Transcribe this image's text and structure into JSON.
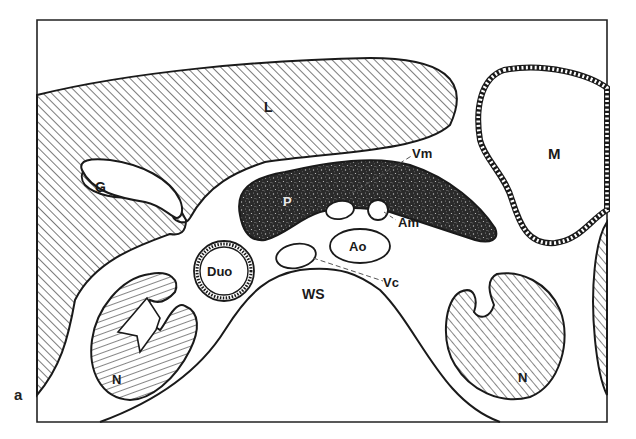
{
  "figure": {
    "panel_label": "a"
  },
  "labels": {
    "liver": "L",
    "gallbladder": "G",
    "pancreas": "P",
    "stomach": "M",
    "duodenum": "Duo",
    "aorta": "Ao",
    "superior_mesenteric_vein": "Vm",
    "superior_mesenteric_artery": "Am",
    "vena_cava": "Vc",
    "spine": "WS",
    "kidney_left": "N",
    "kidney_right": "N"
  },
  "colors": {
    "line": "#1a1a1a",
    "hatch": "#333333",
    "background": "#ffffff",
    "pancreas_fill": "#2a2a2a"
  }
}
